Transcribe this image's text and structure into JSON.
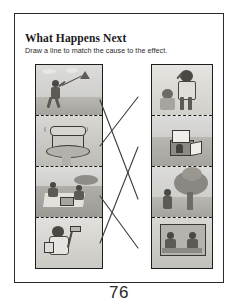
{
  "page": {
    "title": "What Happens Next",
    "instruction": "Draw a line to match the cause to the effect.",
    "page_number": "76",
    "frame_color": "#2c2c2c",
    "line_color": "#3b3b3b"
  },
  "columns": {
    "cause_header": "Cause",
    "effect_header": "Effect"
  },
  "cause_panels": [
    {
      "id": "cause-1",
      "name": "boy-flying-kite",
      "alt": "A boy runs across a field flying a kite in a cloudy sky"
    },
    {
      "id": "cause-2",
      "name": "ringing-telephone",
      "alt": "A push-button telephone ringing on a small table"
    },
    {
      "id": "cause-3",
      "name": "children-having-picnic",
      "alt": "Two children eating a picnic on a blanket outdoors"
    },
    {
      "id": "cause-4",
      "name": "girl-with-paintbrush",
      "alt": "A girl holding a paint roller and a bucket of paint"
    }
  ],
  "effect_panels": [
    {
      "id": "effect-1",
      "name": "boy-answering-phone",
      "alt": "A boy answering a telephone while a small child reaches up"
    },
    {
      "id": "effect-2",
      "name": "painted-doghouse",
      "alt": "A freshly painted doghouse standing on the grass"
    },
    {
      "id": "effect-3",
      "name": "kite-stuck-in-tree",
      "alt": "A child looking up at a kite caught in a tall tree"
    },
    {
      "id": "effect-4",
      "name": "ants-on-picnic-food",
      "alt": "Children at a picnic table with food after the meal"
    }
  ],
  "connectors": [
    {
      "from": "cause-1",
      "to": "effect-3",
      "x1": 100,
      "y1": 100,
      "x2": 138,
      "y2": 199
    },
    {
      "from": "cause-2",
      "to": "effect-1",
      "x1": 100,
      "y1": 146,
      "x2": 138,
      "y2": 97
    },
    {
      "from": "cause-3",
      "to": "effect-4",
      "x1": 100,
      "y1": 196,
      "x2": 138,
      "y2": 248
    },
    {
      "from": "cause-4",
      "to": "effect-2",
      "x1": 100,
      "y1": 243,
      "x2": 138,
      "y2": 147
    }
  ]
}
